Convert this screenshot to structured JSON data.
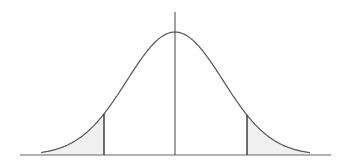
{
  "diagram": {
    "type": "normal-distribution-two-tailed",
    "colors": {
      "background": "#ffffff",
      "curve": "#555555",
      "axis": "#666666",
      "critical_lines": "#333333",
      "center_line": "#444444",
      "tail_fill": "#f0f0f0"
    },
    "geometry": {
      "baseline_y": 155,
      "axis_x_start": 20,
      "axis_x_end": 331,
      "mean_x": 175,
      "peak_y": 32,
      "sigma_px": 48,
      "curve_x_start": 41,
      "curve_x_end": 310,
      "center_line_top_y": 12,
      "left_critical_x": 104,
      "right_critical_x": 247
    },
    "regions": [
      {
        "name": "left-tail",
        "shaded": true
      },
      {
        "name": "right-tail",
        "shaded": true
      }
    ]
  }
}
